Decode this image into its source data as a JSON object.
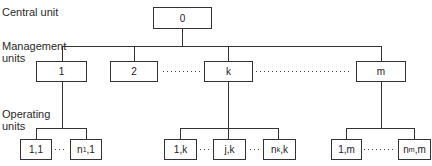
{
  "labels": {
    "central": "Central unit",
    "management_1": "Management",
    "management_2": "units",
    "operating_1": "Operating",
    "operating_2": "units"
  },
  "central_box": "0",
  "management_boxes": [
    "1",
    "2",
    "k",
    "m"
  ],
  "operating_boxes": {
    "group1": [
      "1,1",
      "n",
      "1",
      ",1"
    ],
    "groupk": [
      "1,k",
      "j,k",
      "n",
      "k",
      ",k"
    ],
    "groupm": [
      "1,m",
      "n",
      "m",
      ",m"
    ]
  },
  "colors": {
    "line": "#333333",
    "text": "#222222"
  }
}
